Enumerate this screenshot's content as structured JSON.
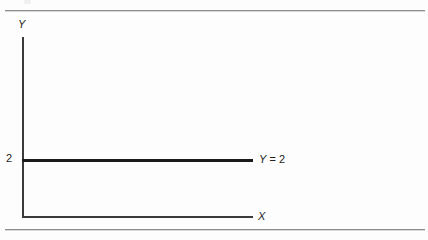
{
  "figure": {
    "background_color": "#fdfdfd",
    "rule_color": "#8d8d90",
    "axis_color": "#3b3b3e",
    "line_color": "#1b1b1d",
    "text_color": "#1f1f22"
  },
  "axes": {
    "y_label": "Y",
    "x_label": "X",
    "y_ticks": [
      {
        "label": "2",
        "value": 2
      }
    ]
  },
  "annotations": {
    "line_label_variable": "Y",
    "line_label_operator": "=",
    "line_label_value": "2"
  },
  "chart_data": {
    "type": "line",
    "title": "",
    "subtitle": "",
    "xlabel": "X",
    "ylabel": "Y",
    "xlim": [
      0,
      10
    ],
    "ylim": [
      0,
      8
    ],
    "grid": false,
    "legend": null,
    "xticks": [],
    "yticks": [
      2
    ],
    "ytick_labels": [
      "2"
    ],
    "series": [
      {
        "name": "Y = 2",
        "equation": "Y = 2",
        "constant_value": 2,
        "x": [
          0,
          10
        ],
        "values": [
          2,
          2
        ],
        "color": "#1b1b1d",
        "linewidth": 2,
        "annotation": "Y = 2",
        "annotation_position": "right-end"
      }
    ]
  }
}
